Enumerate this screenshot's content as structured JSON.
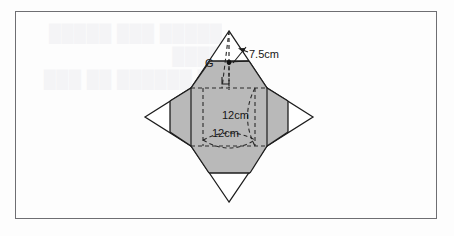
{
  "page": {
    "background_color": "#fdfdfd",
    "frame_color": "#6e6e72"
  },
  "ghost": {
    "line1": "█████ ███ █████ ████",
    "line2": "██ ██████ ██ ███ ██",
    "line3": "██ ████ ███ ██ ████"
  },
  "diagram": {
    "type": "net-of-square-pyramid-with-inscribed-cylinder",
    "fill_color": "#b9b9b9",
    "stroke_color": "#1c1c1c",
    "dash_color": "#2a2a2a",
    "labels": {
      "slant_height": "7.5cm",
      "height": "12cm",
      "base_edge": "12cm",
      "centroid_point": "G"
    },
    "measurements": [
      {
        "name": "slant-height",
        "value": 7.5,
        "unit": "cm"
      },
      {
        "name": "vertical-height",
        "value": 12,
        "unit": "cm"
      },
      {
        "name": "base-edge",
        "value": 12,
        "unit": "cm"
      }
    ],
    "markers": {
      "right_angle": "right-angle-square",
      "point_dot": "point-g-dot",
      "arrow": "leader-arrow-to-slant-edge"
    }
  }
}
